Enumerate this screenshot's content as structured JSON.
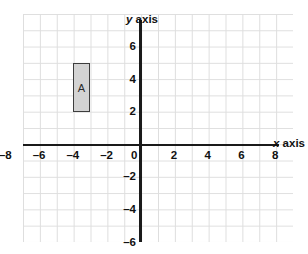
{
  "chart_data": {
    "type": "scatter",
    "title": "",
    "xlabel": "x axis",
    "ylabel": "y axis",
    "grid": true,
    "legend": "none",
    "xlim": [
      -8.6,
      9.4
    ],
    "ylim": [
      -7.0,
      7.0
    ],
    "x_ticks": [
      "–8",
      "–6",
      "–4",
      "–2",
      "0",
      "2",
      "4",
      "6",
      "8"
    ],
    "x_tick_values": [
      -8,
      -6,
      -4,
      -2,
      0,
      2,
      4,
      6,
      8
    ],
    "y_ticks": [
      "6",
      "4",
      "2",
      "0",
      "–2",
      "–4",
      "–6"
    ],
    "y_tick_values": [
      6,
      4,
      2,
      0,
      -2,
      -4,
      -6
    ],
    "grid_step": 1,
    "shapes": [
      {
        "name": "A",
        "label": "A",
        "kind": "rectangle",
        "x_min": -4,
        "x_max": -3,
        "y_min": 2,
        "y_max": 5,
        "width_units": 1,
        "height_units": 3,
        "fill": "#d3d3d3",
        "stroke": "#3d3d3d"
      }
    ]
  },
  "axis_labels": {
    "x_variable": "x",
    "x_word": "axis",
    "y_variable": "y",
    "y_word": "axis"
  },
  "colors": {
    "grid_line": "#dedede",
    "axis_line": "#1a1a1a",
    "text": "#111111",
    "shape_fill": "#d3d3d3",
    "shape_stroke": "#3d3d3d",
    "background": "#ffffff"
  }
}
